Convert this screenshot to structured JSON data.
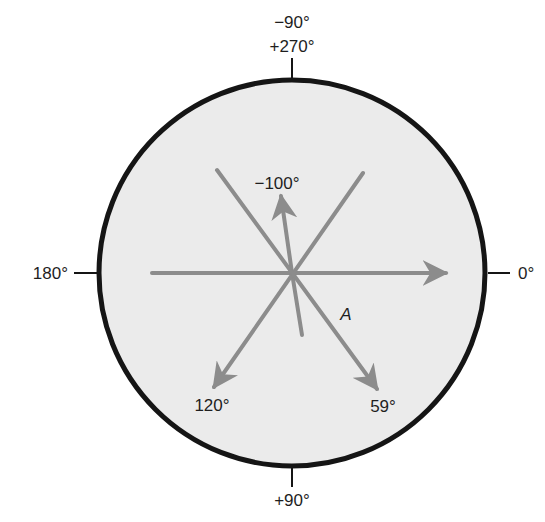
{
  "diagram": {
    "title": "",
    "colors": {
      "circle_fill": "#ebebeb",
      "circle_stroke": "#151515",
      "vector": "#8c8c8c",
      "text": "#1e1e1e"
    },
    "axis_labels": {
      "top_line1": "−90°",
      "top_line2": "+270°",
      "right": "0°",
      "bottom": "+90°",
      "left": "180°"
    },
    "vectors": [
      {
        "name": "vector-0deg",
        "angle_deg": 0,
        "label": "0°",
        "arrow": true
      },
      {
        "name": "vector-minus-100deg",
        "angle_deg": -100,
        "label": "−100°",
        "arrow": true
      },
      {
        "name": "vector-120deg",
        "angle_deg": 120,
        "label": "120°",
        "arrow": true
      },
      {
        "name": "vector-59deg",
        "angle_deg": 59,
        "label": "59°",
        "arrow": true
      }
    ],
    "axis_A": {
      "label": "A",
      "angle_deg": 59
    }
  }
}
